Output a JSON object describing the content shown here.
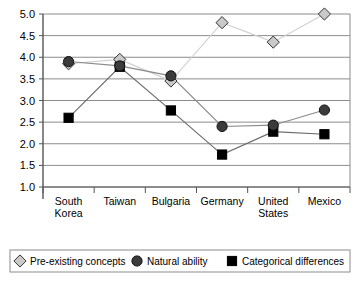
{
  "chart_data": {
    "type": "line",
    "title": "",
    "subtitle": "",
    "xlabel": "",
    "ylabel": "",
    "ylim": [
      1.0,
      5.0
    ],
    "ytick_step": 0.5,
    "grid": true,
    "legend_position": "bottom",
    "categories": [
      "South Korea",
      "Taiwan",
      "Bulgaria",
      "Germany",
      "United States",
      "Mexico"
    ],
    "category_lines": [
      [
        "South",
        "Korea"
      ],
      [
        "Taiwan"
      ],
      [
        "Bulgaria"
      ],
      [
        "Germany"
      ],
      [
        "United",
        "States"
      ],
      [
        "Mexico"
      ]
    ],
    "ytick_labels": [
      "5.0",
      "4.5",
      "4.0",
      "3.5",
      "3.0",
      "2.5",
      "2.0",
      "1.5",
      "1.0"
    ],
    "ytick_values": [
      5.0,
      4.5,
      4.0,
      3.5,
      3.0,
      2.5,
      2.0,
      1.5,
      1.0
    ],
    "series": [
      {
        "name": "Pre-existing concepts",
        "marker": "diamond",
        "marker_fill": "#c9c9c9",
        "marker_stroke": "#333333",
        "line_color": "#d0d0d0",
        "values": [
          3.85,
          3.95,
          3.45,
          4.8,
          4.35,
          5.0
        ]
      },
      {
        "name": "Natural ability",
        "marker": "circle",
        "marker_fill": "#3b3b3b",
        "marker_stroke": "#111111",
        "line_color": "#8a8a8a",
        "values": [
          3.9,
          3.8,
          3.57,
          2.4,
          2.43,
          2.78
        ]
      },
      {
        "name": "Categorical differences",
        "marker": "square",
        "marker_fill": "#000000",
        "marker_stroke": "#000000",
        "line_color": "#6a6a6a",
        "values": [
          2.6,
          3.78,
          2.77,
          1.75,
          2.28,
          2.22
        ]
      }
    ]
  },
  "legend": {
    "items": [
      {
        "label": "Pre-existing concepts",
        "marker": "diamond"
      },
      {
        "label": "Natural ability",
        "marker": "circle"
      },
      {
        "label": "Categorical differences",
        "marker": "square"
      }
    ]
  },
  "colors": {
    "axis": "#555555",
    "grid": "#8c8c8c",
    "background": "#ffffff",
    "legend_border": "#8c8c8c",
    "text": "#000000"
  }
}
